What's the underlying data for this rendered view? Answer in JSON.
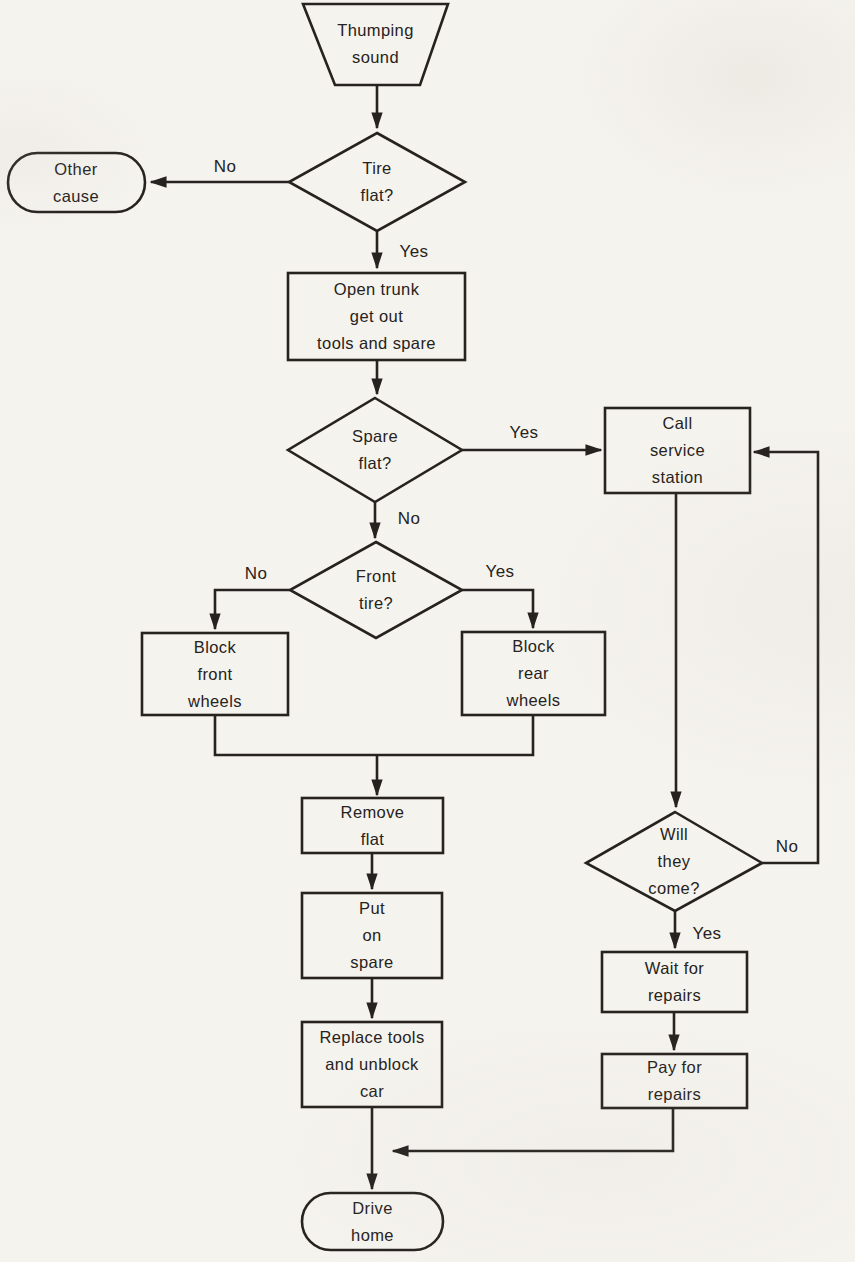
{
  "colors": {
    "ink": "#262220",
    "paper": "#f5f3ee"
  },
  "flowchart": {
    "nodes": {
      "thumping_sound": {
        "label": "Thumping\nsound",
        "shape": "trapezoid"
      },
      "tire_flat": {
        "label": "Tire\nflat?",
        "shape": "decision"
      },
      "other_cause": {
        "label": "Other\ncause",
        "shape": "terminator"
      },
      "open_trunk": {
        "label": "Open trunk\nget out\ntools and spare",
        "shape": "process"
      },
      "spare_flat": {
        "label": "Spare\nflat?",
        "shape": "decision"
      },
      "call_service_station": {
        "label": "Call\nservice\nstation",
        "shape": "process"
      },
      "front_tire": {
        "label": "Front\ntire?",
        "shape": "decision"
      },
      "block_front_wheels": {
        "label": "Block\nfront\nwheels",
        "shape": "process"
      },
      "block_rear_wheels": {
        "label": "Block\nrear\nwheels",
        "shape": "process"
      },
      "remove_flat": {
        "label": "Remove\nflat",
        "shape": "process"
      },
      "put_on_spare": {
        "label": "Put\non\nspare",
        "shape": "process"
      },
      "replace_tools": {
        "label": "Replace tools\nand unblock\ncar",
        "shape": "process"
      },
      "will_they_come": {
        "label": "Will\nthey\ncome?",
        "shape": "decision"
      },
      "wait_for_repairs": {
        "label": "Wait for\nrepairs",
        "shape": "process"
      },
      "pay_for_repairs": {
        "label": "Pay for\nrepairs",
        "shape": "process"
      },
      "drive_home": {
        "label": "Drive\nhome",
        "shape": "terminator"
      }
    },
    "edge_labels": {
      "tire_flat_no": "No",
      "tire_flat_yes": "Yes",
      "spare_flat_yes": "Yes",
      "spare_flat_no": "No",
      "front_tire_no": "No",
      "front_tire_yes": "Yes",
      "will_they_come_no": "No",
      "will_they_come_yes": "Yes"
    }
  }
}
